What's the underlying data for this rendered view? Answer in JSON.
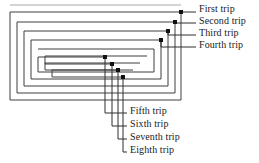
{
  "figure": {
    "type": "spiral-trip-diagram",
    "stroke_color": "#3a3a3a",
    "faint_stroke_color": "#9a9a9a",
    "dot_color": "#111111",
    "background": "#ffffff"
  },
  "labels": [
    {
      "id": "first",
      "text": "First trip",
      "x": 199,
      "y": 9,
      "dot_x": 181,
      "dot_y": 12,
      "leader_x": 196,
      "leader_y": 12
    },
    {
      "id": "second",
      "text": "Second trip",
      "x": 199,
      "y": 21,
      "dot_x": 175,
      "dot_y": 22,
      "leader_x": 196,
      "leader_y": 23
    },
    {
      "id": "third",
      "text": "Third trip",
      "x": 199,
      "y": 33,
      "dot_x": 168,
      "dot_y": 31,
      "leader_x": 196,
      "leader_y": 35
    },
    {
      "id": "fourth",
      "text": "Fourth trip",
      "x": 199,
      "y": 45,
      "dot_x": 161,
      "dot_y": 40,
      "leader_x": 196,
      "leader_y": 47
    },
    {
      "id": "fifth",
      "text": "Fifth trip",
      "x": 130,
      "y": 111,
      "dot_x": 105,
      "dot_y": 57,
      "leader_x": 127,
      "leader_y": 113
    },
    {
      "id": "sixth",
      "text": "Sixth trip",
      "x": 130,
      "y": 124,
      "dot_x": 112,
      "dot_y": 64,
      "leader_x": 127,
      "leader_y": 126
    },
    {
      "id": "seventh",
      "text": "Seventh trip",
      "x": 130,
      "y": 137,
      "dot_x": 118,
      "dot_y": 70,
      "leader_x": 127,
      "leader_y": 139
    },
    {
      "id": "eighth",
      "text": "Eighth trip",
      "x": 130,
      "y": 150,
      "dot_x": 123,
      "dot_y": 77,
      "leader_x": 127,
      "leader_y": 152
    }
  ],
  "spiral": {
    "arms": 8,
    "outer_rect": {
      "left": 10,
      "top": 11,
      "right": 181,
      "bottom": 100
    },
    "ring_gap": 7
  }
}
